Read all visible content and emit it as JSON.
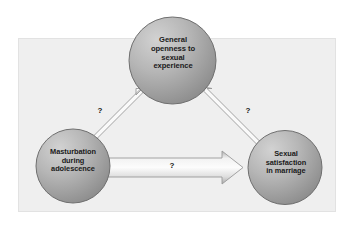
{
  "figure": {
    "panel_background": "#efefef",
    "canvas_background": "#ffffff",
    "node_fill_light": "#c9c9c9",
    "node_fill_dark": "#8e8e8e",
    "node_stroke": "#6f6f6f",
    "arrow_fill_light": "#fafafa",
    "arrow_fill_dark": "#b4b4b4",
    "arrow_stroke": "#9a9a9a",
    "text_color": "#1a1a1a"
  },
  "nodes": [
    {
      "id": "general-openness",
      "label": "General\nopenness to\nsexual\nexperience",
      "shape": "circle"
    },
    {
      "id": "masturbation-adolescence",
      "label": "Masturbation\nduring\nadolescence",
      "shape": "circle"
    },
    {
      "id": "sexual-satisfaction",
      "label": "Sexual\nsatisfaction\nin marriage",
      "shape": "circle"
    }
  ],
  "arrows": [
    {
      "id": "openness-to-masturbation",
      "from": "general-openness",
      "to": "masturbation-adolescence",
      "label": "?",
      "direction": "down-left"
    },
    {
      "id": "openness-to-satisfaction",
      "from": "general-openness",
      "to": "sexual-satisfaction",
      "label": "?",
      "direction": "down-right"
    },
    {
      "id": "masturbation-to-satisfaction",
      "from": "masturbation-adolescence",
      "to": "sexual-satisfaction",
      "label": "?",
      "direction": "right"
    }
  ]
}
